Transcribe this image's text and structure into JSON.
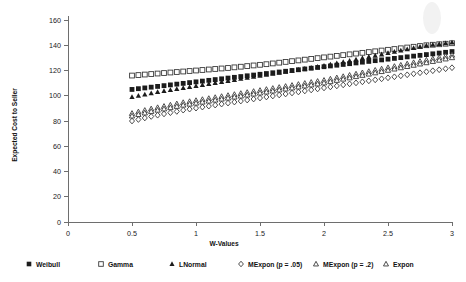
{
  "chart_data": {
    "type": "scatter",
    "title": "",
    "xlabel": "W-Values",
    "ylabel": "Expected Cost to Seller",
    "xlim": [
      0,
      3
    ],
    "ylim": [
      0,
      160
    ],
    "xticks": [
      0,
      0.5,
      1,
      1.5,
      2,
      2.5,
      3
    ],
    "xtick_labels": [
      "0",
      "0.5",
      "1",
      "1.5",
      "2",
      "2.5",
      "3"
    ],
    "yticks": [
      0,
      20,
      40,
      60,
      80,
      100,
      120,
      140,
      160
    ],
    "ytick_labels": [
      "0",
      "20",
      "40",
      "60",
      "80",
      "100",
      "120",
      "140",
      "160"
    ],
    "grid": false,
    "legend_position": "bottom",
    "x": [
      0.5,
      0.55,
      0.6,
      0.65,
      0.7,
      0.75,
      0.8,
      0.85,
      0.9,
      0.95,
      1.0,
      1.05,
      1.1,
      1.15,
      1.2,
      1.25,
      1.3,
      1.35,
      1.4,
      1.45,
      1.5,
      1.55,
      1.6,
      1.65,
      1.7,
      1.75,
      1.8,
      1.85,
      1.9,
      1.95,
      2.0,
      2.05,
      2.1,
      2.15,
      2.2,
      2.25,
      2.3,
      2.35,
      2.4,
      2.45,
      2.5,
      2.55,
      2.6,
      2.65,
      2.7,
      2.75,
      2.8,
      2.85,
      2.9,
      2.95,
      3.0
    ],
    "series": [
      {
        "name": "Weibull",
        "marker": "filled-square",
        "values": [
          105.0,
          105.6,
          106.2,
          106.8,
          107.4,
          108.0,
          108.6,
          109.2,
          109.8,
          110.4,
          111.0,
          111.6,
          112.2,
          112.8,
          113.4,
          114.0,
          114.6,
          115.2,
          115.8,
          116.4,
          117.0,
          117.6,
          118.2,
          118.8,
          119.4,
          120.0,
          120.6,
          121.2,
          121.8,
          122.4,
          123.0,
          123.6,
          124.2,
          124.8,
          125.4,
          126.0,
          126.6,
          127.2,
          127.8,
          128.4,
          129.0,
          129.6,
          130.2,
          130.8,
          131.4,
          132.0,
          132.6,
          133.2,
          133.8,
          134.4,
          135.0
        ]
      },
      {
        "name": "Gamma",
        "marker": "open-square",
        "values": [
          116.0,
          116.4,
          116.8,
          117.2,
          117.6,
          118.0,
          118.4,
          118.8,
          119.2,
          119.6,
          120.0,
          120.4,
          120.8,
          121.2,
          121.6,
          122.0,
          122.5,
          123.0,
          123.5,
          124.0,
          124.5,
          125.0,
          125.6,
          126.2,
          126.8,
          127.4,
          128.0,
          128.6,
          129.2,
          129.8,
          130.4,
          131.0,
          131.6,
          132.2,
          132.8,
          133.4,
          134.0,
          134.6,
          135.2,
          135.8,
          136.4,
          137.0,
          137.6,
          138.2,
          138.8,
          139.4,
          140.0,
          140.4,
          140.8,
          141.2,
          141.6
        ]
      },
      {
        "name": "LNormal",
        "marker": "filled-triangle",
        "values": [
          99.0,
          100.0,
          101.0,
          102.0,
          103.0,
          103.8,
          104.6,
          105.4,
          106.2,
          107.0,
          107.8,
          108.6,
          109.4,
          110.2,
          111.0,
          111.8,
          112.6,
          113.4,
          114.2,
          115.0,
          115.8,
          116.6,
          117.4,
          118.2,
          119.0,
          119.8,
          120.6,
          121.4,
          122.2,
          123.0,
          123.8,
          124.8,
          125.8,
          126.8,
          127.8,
          128.8,
          129.8,
          130.8,
          131.8,
          132.8,
          133.8,
          134.8,
          135.8,
          136.8,
          137.8,
          138.8,
          139.8,
          140.4,
          141.0,
          141.6,
          142.2
        ]
      },
      {
        "name": "MExpon (p = .05)",
        "marker": "open-diamond",
        "values": [
          80.0,
          81.2,
          82.4,
          83.6,
          84.6,
          85.6,
          86.6,
          87.6,
          88.6,
          89.4,
          90.2,
          91.0,
          91.8,
          92.6,
          93.4,
          94.2,
          95.0,
          95.8,
          96.6,
          97.4,
          98.2,
          99.0,
          99.8,
          100.6,
          101.4,
          102.2,
          103.0,
          103.8,
          104.6,
          105.4,
          106.2,
          107.0,
          107.8,
          108.6,
          109.4,
          110.2,
          111.0,
          111.8,
          112.6,
          113.4,
          114.2,
          115.0,
          115.8,
          116.6,
          117.4,
          118.2,
          119.0,
          119.8,
          120.6,
          121.4,
          122.2
        ]
      },
      {
        "name": "MExpon (p = .2)",
        "marker": "open-triangle",
        "values": [
          86.0,
          87.2,
          88.4,
          89.6,
          90.6,
          91.6,
          92.6,
          93.6,
          94.6,
          95.4,
          96.2,
          97.0,
          97.8,
          98.6,
          99.4,
          100.2,
          101.0,
          101.8,
          102.6,
          103.4,
          104.2,
          105.0,
          105.8,
          106.6,
          107.4,
          108.2,
          109.0,
          109.8,
          110.6,
          111.4,
          112.2,
          113.2,
          114.2,
          115.2,
          116.2,
          117.2,
          118.2,
          119.2,
          120.2,
          121.2,
          122.2,
          123.2,
          124.2,
          125.2,
          126.2,
          127.2,
          128.2,
          129.2,
          130.2,
          131.2,
          132.2
        ]
      },
      {
        "name": "Expon",
        "marker": "open-triangle",
        "values": [
          84.0,
          85.2,
          86.4,
          87.6,
          88.6,
          89.6,
          90.6,
          91.6,
          92.6,
          93.4,
          94.2,
          95.0,
          95.8,
          96.6,
          97.4,
          98.2,
          99.0,
          99.8,
          100.6,
          101.4,
          102.2,
          103.0,
          103.8,
          104.6,
          105.4,
          106.2,
          107.0,
          107.8,
          108.6,
          109.4,
          110.2,
          111.2,
          112.2,
          113.2,
          114.2,
          115.2,
          116.2,
          117.2,
          118.2,
          119.2,
          120.2,
          121.2,
          122.2,
          123.2,
          124.2,
          125.2,
          126.2,
          127.2,
          128.2,
          129.2,
          130.2
        ]
      }
    ]
  },
  "legend": {
    "items": [
      {
        "label": "Weibull",
        "marker": "filled-square"
      },
      {
        "label": "Gamma",
        "marker": "open-square"
      },
      {
        "label": "LNormal",
        "marker": "filled-triangle"
      },
      {
        "label": "MExpon (p = .05)",
        "marker": "open-diamond"
      },
      {
        "label": "MExpon (p = .2)",
        "marker": "open-triangle"
      },
      {
        "label": "Expon",
        "marker": "open-triangle"
      }
    ]
  },
  "colors": {
    "axis": "#6e6e6e",
    "marker_fill": "#1c1c1c",
    "marker_open_stroke": "#3a3a3a",
    "background": "#ffffff"
  }
}
